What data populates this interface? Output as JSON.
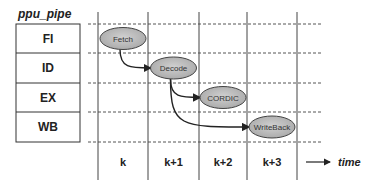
{
  "diagram": {
    "title": "ppu_pipe",
    "stages": [
      "FI",
      "ID",
      "EX",
      "WB"
    ],
    "time_ticks": [
      "k",
      "k+1",
      "k+2",
      "k+3"
    ],
    "time_label": "time",
    "nodes": [
      {
        "id": "fetch",
        "label": "Fetch",
        "stage": 0,
        "tick": 0
      },
      {
        "id": "decode",
        "label": "Decode",
        "stage": 1,
        "tick": 1
      },
      {
        "id": "cordic",
        "label": "CORDIC",
        "stage": 2,
        "tick": 2
      },
      {
        "id": "writeback",
        "label": "WriteBack",
        "stage": 3,
        "tick": 3
      }
    ],
    "edges": [
      {
        "from": "fetch",
        "to": "decode"
      },
      {
        "from": "decode",
        "to": "cordic"
      },
      {
        "from": "decode",
        "to": "writeback"
      }
    ],
    "colors": {
      "node_fill": "#b8b8b8",
      "line": "#333333",
      "grid": "#555555"
    }
  }
}
